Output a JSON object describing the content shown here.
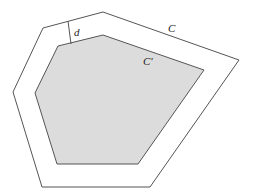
{
  "diagram": {
    "outer": {
      "label": "C",
      "points": "43,28 103,12 239,60 150,187 42,187 13,92",
      "stroke": "#555555",
      "fill": "#ffffff"
    },
    "inner": {
      "label": "C'",
      "points": "58,46 103,35 204,70 138,164 57,164 35,93",
      "stroke": "#555555",
      "fill": "#dcdcdc"
    },
    "distance": {
      "label": "d",
      "x1": 68,
      "y1": 21,
      "x2": 71,
      "y2": 44
    }
  }
}
